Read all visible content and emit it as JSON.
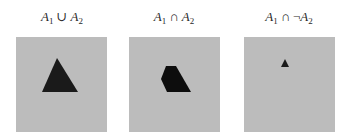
{
  "figure": {
    "panels": [
      {
        "id": "union",
        "label": {
          "left_var": "A",
          "left_sub": "1",
          "operator": "∪",
          "negation": "",
          "right_var": "A",
          "right_sub": "2"
        },
        "expression": "A1 ∪ A2",
        "background_color": "#bcbcbc",
        "shape": {
          "name": "triangle",
          "color": "#1a1a1a"
        }
      },
      {
        "id": "intersection",
        "label": {
          "left_var": "A",
          "left_sub": "1",
          "operator": "∩",
          "negation": "",
          "right_var": "A",
          "right_sub": "2"
        },
        "expression": "A1 ∩ A2",
        "background_color": "#bcbcbc",
        "shape": {
          "name": "pentagon",
          "color": "#0d0d0d"
        }
      },
      {
        "id": "difference",
        "label": {
          "left_var": "A",
          "left_sub": "1",
          "operator": "∩",
          "negation": "¬",
          "right_var": "A",
          "right_sub": "2"
        },
        "expression": "A1 ∩ ¬A2",
        "background_color": "#bcbcbc",
        "shape": {
          "name": "small-triangle",
          "color": "#1a1a1a"
        }
      }
    ]
  }
}
